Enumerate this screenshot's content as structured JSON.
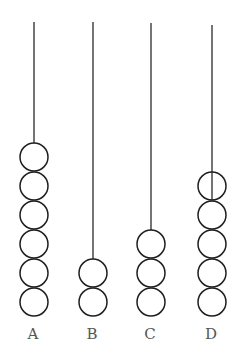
{
  "diagram": {
    "type": "abacus-rods",
    "bead_radius": 14,
    "bead_spacing": 29,
    "bottom_bead_center_y": 302,
    "rods": [
      {
        "label": "A",
        "x": 34,
        "rod_top": 22,
        "bead_count": 6
      },
      {
        "label": "B",
        "x": 93,
        "rod_top": 22,
        "bead_count": 2
      },
      {
        "label": "C",
        "x": 151,
        "rod_top": 23,
        "bead_count": 3
      },
      {
        "label": "D",
        "x": 212,
        "rod_top": 25,
        "bead_count": 5,
        "rod_through_top_bead": true
      }
    ],
    "label_y": 339
  }
}
